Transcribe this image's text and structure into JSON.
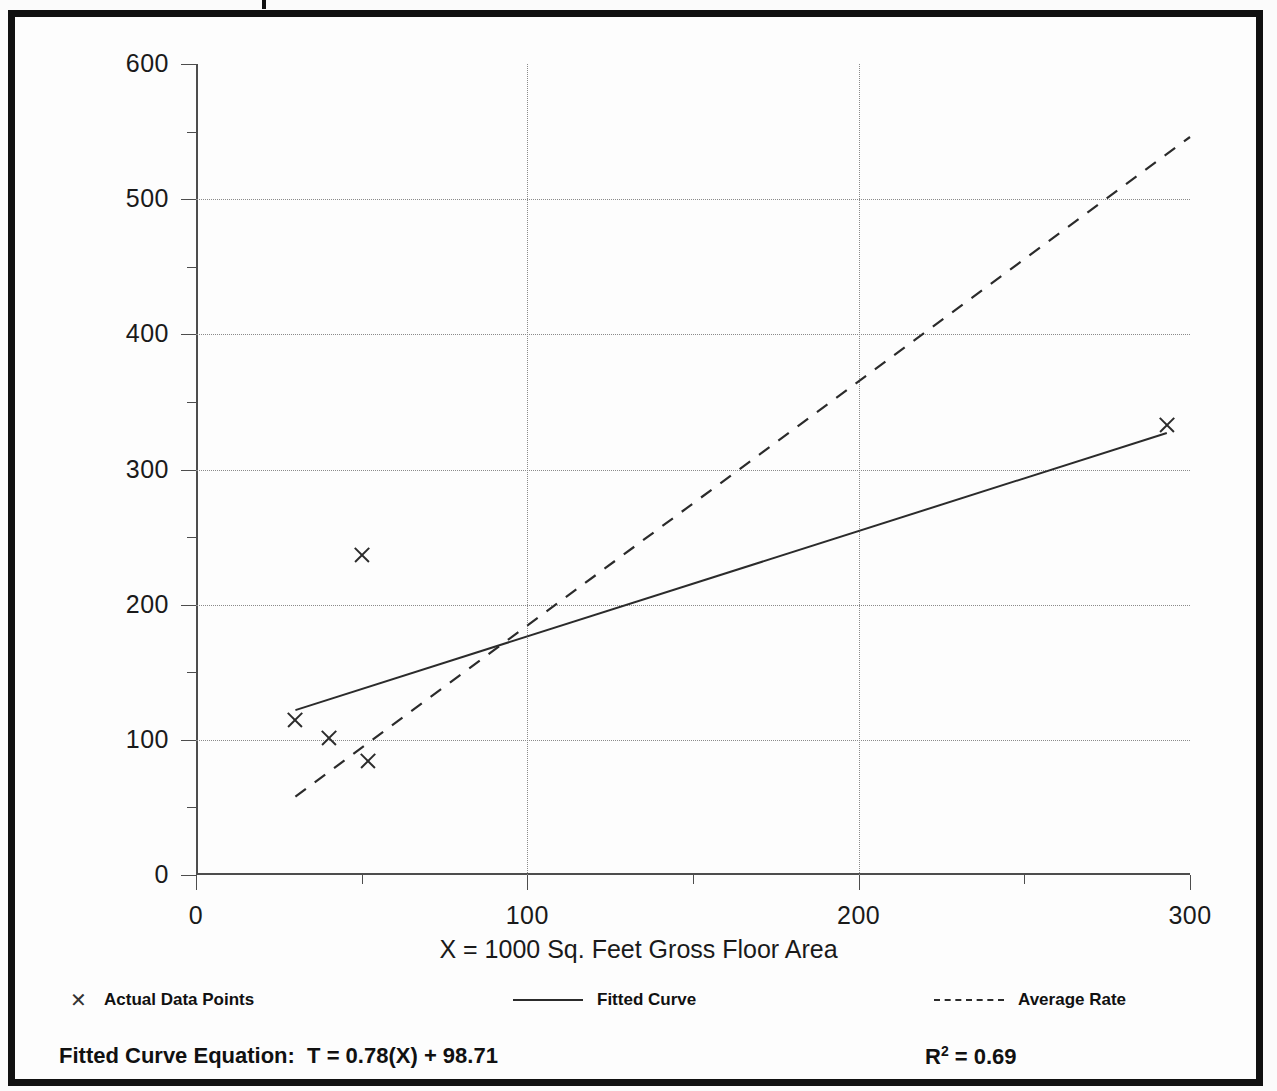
{
  "chart_data": {
    "type": "scatter",
    "title": "",
    "xlabel": "X = 1000 Sq. Feet Gross Floor Area",
    "ylabel": "T = Average Vehicle Trip Ends",
    "xlim": [
      0,
      300
    ],
    "ylim": [
      0,
      600
    ],
    "xticks": [
      0,
      100,
      200,
      300
    ],
    "yticks": [
      0,
      100,
      200,
      300,
      400,
      500,
      600
    ],
    "xtick_labels": [
      "0",
      "100",
      "200",
      "300"
    ],
    "ytick_labels": [
      "0",
      "100",
      "200",
      "300",
      "400",
      "500",
      "600"
    ],
    "xminor_step": 50,
    "yminor_step": 50,
    "grid": true,
    "legend_position": "below-axes",
    "series": [
      {
        "name": "Actual Data Points",
        "type": "scatter",
        "marker": "x",
        "points": [
          {
            "x": 30,
            "y": 115
          },
          {
            "x": 40,
            "y": 101
          },
          {
            "x": 52,
            "y": 84
          },
          {
            "x": 50,
            "y": 237
          },
          {
            "x": 293,
            "y": 333
          }
        ]
      },
      {
        "name": "Fitted Curve",
        "type": "line",
        "style": "solid",
        "points": [
          {
            "x": 30,
            "y": 122
          },
          {
            "x": 293,
            "y": 327
          }
        ],
        "equation": "T = 0.78(X) + 98.71",
        "slope": 0.78,
        "intercept": 98.71,
        "r_squared": 0.69
      },
      {
        "name": "Average Rate",
        "type": "line",
        "style": "dashed",
        "points": [
          {
            "x": 30,
            "y": 58
          },
          {
            "x": 300,
            "y": 546
          }
        ],
        "rate": 1.82
      }
    ],
    "annotations": [
      {
        "text": "Fitted Curve Equation:  T = 0.78(X) + 98.71",
        "position": "bottom-left"
      },
      {
        "text": "R2 = 0.69",
        "position": "bottom-right"
      }
    ]
  },
  "axes": {
    "y_title": "T = Average Vehicle Trip Ends",
    "x_title": "X = 1000 Sq. Feet Gross Floor Area"
  },
  "legend": {
    "items": [
      {
        "symbol": "x-marker",
        "label": "Actual Data Points"
      },
      {
        "symbol": "solid-line",
        "label": "Fitted Curve"
      },
      {
        "symbol": "dashed-line",
        "label": "Average Rate"
      }
    ]
  },
  "footer": {
    "equation_label": "Fitted Curve Equation:  T = 0.78(X) + 98.71",
    "r2_prefix": "R",
    "r2_exponent": "2",
    "r2_value": " = 0.69"
  }
}
